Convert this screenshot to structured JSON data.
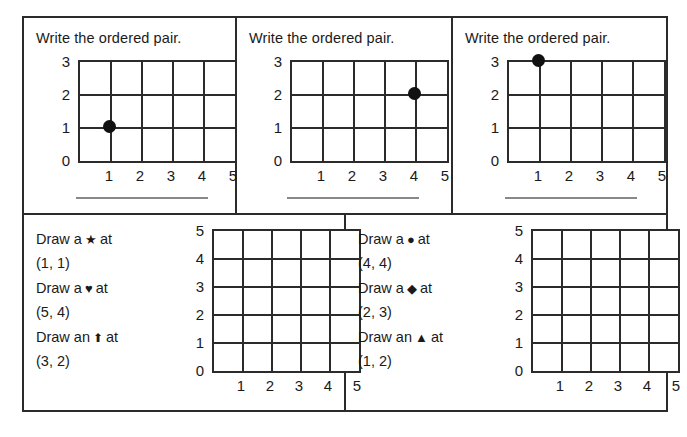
{
  "worksheet": {
    "top_panels": [
      {
        "prompt": "Write the ordered pair.",
        "grid": {
          "x_ticks": [
            "1",
            "2",
            "3",
            "4",
            "5"
          ],
          "y_ticks": [
            "0",
            "1",
            "2",
            "3"
          ],
          "cols": 5,
          "rows": 3
        },
        "point": {
          "x": 1,
          "y": 1,
          "label": "(1, 1)"
        },
        "answer_line": ""
      },
      {
        "prompt": "Write the ordered pair.",
        "grid": {
          "x_ticks": [
            "1",
            "2",
            "3",
            "4",
            "5"
          ],
          "y_ticks": [
            "0",
            "1",
            "2",
            "3"
          ],
          "cols": 5,
          "rows": 3
        },
        "point": {
          "x": 4,
          "y": 2,
          "label": "(4, 2)"
        },
        "answer_line": ""
      },
      {
        "prompt": "Write the ordered pair.",
        "grid": {
          "x_ticks": [
            "1",
            "2",
            "3",
            "4",
            "5"
          ],
          "y_ticks": [
            "0",
            "1",
            "2",
            "3"
          ],
          "cols": 5,
          "rows": 3
        },
        "point": {
          "x": 1,
          "y": 3,
          "label": "(1, 3)"
        },
        "answer_line": ""
      }
    ],
    "bottom_panels": [
      {
        "tasks": [
          {
            "lead": "Draw a",
            "symbol": "★",
            "symbol_name": "star",
            "mid": "at",
            "coords": "(1, 1)"
          },
          {
            "lead": "Draw a",
            "symbol": "♥",
            "symbol_name": "heart",
            "mid": "at",
            "coords": "(5, 4)"
          },
          {
            "lead": "Draw an",
            "symbol": "⬆",
            "symbol_name": "arrow-up",
            "mid": "at",
            "coords": "(3, 2)"
          }
        ],
        "grid": {
          "x_ticks": [
            "1",
            "2",
            "3",
            "4",
            "5"
          ],
          "y_ticks": [
            "0",
            "1",
            "2",
            "3",
            "4",
            "5"
          ],
          "cols": 5,
          "rows": 5
        }
      },
      {
        "tasks": [
          {
            "lead": "Draw a",
            "symbol": "●",
            "symbol_name": "circle",
            "mid": "at",
            "coords": "(4, 4)"
          },
          {
            "lead": "Draw a",
            "symbol": "◆",
            "symbol_name": "diamond",
            "mid": "at",
            "coords": "(2, 3)"
          },
          {
            "lead": "Draw an",
            "symbol": "▲",
            "symbol_name": "triangle",
            "mid": "at",
            "coords": "(1, 2)"
          }
        ],
        "grid": {
          "x_ticks": [
            "1",
            "2",
            "3",
            "4",
            "5"
          ],
          "y_ticks": [
            "0",
            "1",
            "2",
            "3",
            "4",
            "5"
          ],
          "cols": 5,
          "rows": 5
        }
      }
    ]
  },
  "colors": {
    "ink": "#2b2b2b",
    "point": "#111111",
    "answer_rule": "#888888",
    "paper": "#ffffff"
  }
}
